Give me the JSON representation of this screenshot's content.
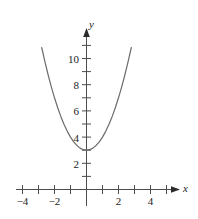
{
  "chart_data": {
    "type": "line",
    "title": "",
    "xlabel": "x",
    "ylabel": "y",
    "equation": "y = x^2 + 3",
    "vertex": [
      0,
      3
    ],
    "xlim": [
      -5,
      5
    ],
    "ylim": [
      -1,
      11.6
    ],
    "grid": false,
    "legend": null,
    "axis_arrows": true,
    "x_tick_values": [
      -5,
      -4,
      -3,
      -2,
      -1,
      1,
      2,
      3,
      4,
      5
    ],
    "y_tick_values": [
      1,
      2,
      3,
      4,
      5,
      6,
      7,
      8,
      9,
      10,
      11
    ],
    "x_tick_labels": [
      {
        "value": -4,
        "text": "−4"
      },
      {
        "value": -2,
        "text": "−2"
      },
      {
        "value": 2,
        "text": "2"
      },
      {
        "value": 4,
        "text": "4"
      }
    ],
    "y_tick_labels": [
      {
        "value": 2,
        "text": "2"
      },
      {
        "value": 4,
        "text": "4"
      },
      {
        "value": 6,
        "text": "6"
      },
      {
        "value": 8,
        "text": "8"
      },
      {
        "value": 10,
        "text": "10"
      }
    ],
    "series": [
      {
        "name": "parabola",
        "color": "#6b6b6b",
        "x": [
          -2.8,
          -2.6,
          -2.4,
          -2.2,
          -2.0,
          -1.8,
          -1.6,
          -1.4,
          -1.2,
          -1.0,
          -0.8,
          -0.6,
          -0.4,
          -0.2,
          0.0,
          0.2,
          0.4,
          0.6,
          0.8,
          1.0,
          1.2,
          1.4,
          1.6,
          1.8,
          2.0,
          2.2,
          2.4,
          2.6,
          2.8
        ],
        "values": [
          10.84,
          9.76,
          8.76,
          7.84,
          7.0,
          6.24,
          5.56,
          4.96,
          4.44,
          4.0,
          3.64,
          3.36,
          3.16,
          3.04,
          3.0,
          3.04,
          3.16,
          3.36,
          3.64,
          4.0,
          4.44,
          4.96,
          5.56,
          6.24,
          7.0,
          7.84,
          8.76,
          9.76,
          10.84
        ]
      }
    ],
    "axis_color": "#4d4d4d"
  },
  "labels": {
    "x_axis_name": "x",
    "y_axis_name": "y",
    "xm4": "−4",
    "xm2": "−2",
    "x2": "2",
    "x4": "4",
    "y2": "2",
    "y4": "4",
    "y6": "6",
    "y8": "8",
    "y10": "10"
  }
}
